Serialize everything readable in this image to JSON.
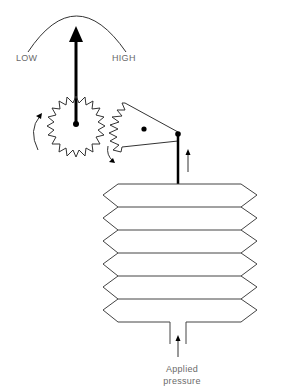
{
  "labels": {
    "low": "LOW",
    "high": "HIGH",
    "applied_line1": "Applied",
    "applied_line2": "pressure"
  },
  "components": {
    "dial_arc": "scale arc from LOW to HIGH",
    "pointer": "needle pointer-icon",
    "pinion_gear": "small gear-icon",
    "sector_gear": "sector gear-icon",
    "linkage_rod": "connecting rod",
    "bellows": "bellows with 6 convolutions",
    "inlet": "pressure inlet tube"
  },
  "colors": {
    "stroke": "#333333",
    "thick_stroke": "#000000",
    "label": "#6a6a6a",
    "background": "#ffffff"
  }
}
